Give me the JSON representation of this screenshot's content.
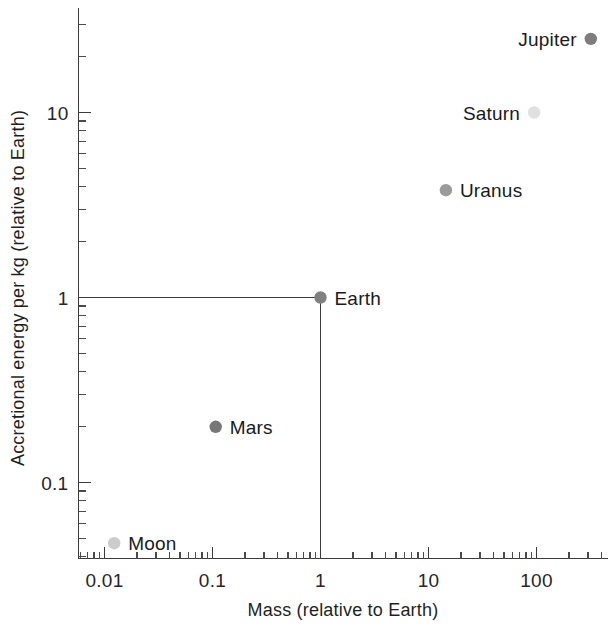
{
  "chart_data": {
    "type": "scatter",
    "title": "",
    "xlabel": "Mass (relative to Earth)",
    "ylabel": "Accretional energy per kg (relative to Earth)",
    "xscale": "log",
    "yscale": "log",
    "xlim": [
      0.007,
      620
    ],
    "ylim": [
      0.036,
      40
    ],
    "grid": false,
    "legend": "none",
    "x_ticklabels": [
      "0.01",
      "0.1",
      "1",
      "10",
      "100"
    ],
    "x_tickvalues": [
      0.01,
      0.1,
      1,
      10,
      100
    ],
    "y_ticklabels": [
      "0.1",
      "1",
      "10"
    ],
    "y_tickvalues": [
      0.1,
      1,
      10
    ],
    "points": [
      {
        "label": "Moon",
        "x": 0.0123,
        "y": 0.047,
        "color": "#cccccc",
        "label_side": "right"
      },
      {
        "label": "Mars",
        "x": 0.107,
        "y": 0.2,
        "color": "#777777",
        "label_side": "right"
      },
      {
        "label": "Earth",
        "x": 1.0,
        "y": 1.0,
        "color": "#808080",
        "label_side": "right"
      },
      {
        "label": "Uranus",
        "x": 14.5,
        "y": 3.8,
        "color": "#9a9a9a",
        "label_side": "right"
      },
      {
        "label": "Saturn",
        "x": 95.0,
        "y": 10.0,
        "color": "#e0e0e0",
        "label_side": "left"
      },
      {
        "label": "Jupiter",
        "x": 318.0,
        "y": 25.0,
        "color": "#7d7d7d",
        "label_side": "left"
      }
    ],
    "reference_lines": [
      {
        "name": "earth-horizontal-guide",
        "orientation": "horizontal",
        "value": 1
      },
      {
        "name": "earth-vertical-guide",
        "orientation": "vertical",
        "value": 1
      }
    ],
    "annotations": []
  },
  "axes": {
    "x_title": "Mass (relative to Earth)",
    "y_title": "Accretional energy per kg (relative to Earth)"
  },
  "colors": {
    "axis": "#3a3a3a",
    "text": "#1a1a1a",
    "background": "#ffffff"
  }
}
